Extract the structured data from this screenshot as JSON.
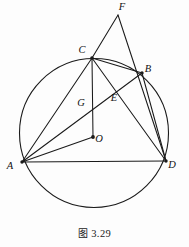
{
  "figure": {
    "caption_prefix": "图",
    "caption_number": "3.29",
    "caption_full": "图 3.29",
    "background_color": "#fdfdfd",
    "stroke_color": "#1a1a1a",
    "label_color": "#111111"
  },
  "geometry": {
    "type": "circle-with-inscribed-quadrilateral",
    "circle": {
      "name": "circumcircle",
      "center_label": "O",
      "cx": 94,
      "cy": 133,
      "r": 74.5,
      "stroke_width": 1.1
    },
    "points": [
      {
        "id": "F",
        "label": "F",
        "x": 118,
        "y": 15,
        "label_x": 122,
        "label_y": 10,
        "on_circle": false,
        "dot": false
      },
      {
        "id": "C",
        "label": "C",
        "x": 92,
        "y": 58,
        "label_x": 82,
        "label_y": 53,
        "on_circle": true,
        "dot": true
      },
      {
        "id": "B",
        "label": "B",
        "x": 142,
        "y": 73,
        "label_x": 148,
        "label_y": 72,
        "on_circle": true,
        "dot": true
      },
      {
        "id": "G",
        "label": "G",
        "x": 92,
        "y": 105,
        "label_x": 81,
        "label_y": 106,
        "on_circle": false,
        "dot": false
      },
      {
        "id": "E",
        "label": "E",
        "x": 111,
        "y": 99,
        "label_x": 114,
        "label_y": 101,
        "on_circle": false,
        "dot": false
      },
      {
        "id": "O",
        "label": "O",
        "x": 93,
        "y": 137,
        "label_x": 99,
        "label_y": 142,
        "on_circle": false,
        "dot": true
      },
      {
        "id": "A",
        "label": "A",
        "x": 22,
        "y": 162,
        "label_x": 10,
        "label_y": 169,
        "on_circle": true,
        "dot": true
      },
      {
        "id": "D",
        "label": "D",
        "x": 166,
        "y": 161,
        "label_x": 172,
        "label_y": 168,
        "on_circle": true,
        "dot": true
      }
    ],
    "segments": [
      {
        "id": "FC",
        "from": "F",
        "to": "C",
        "x1": 118,
        "y1": 15,
        "x2": 92,
        "y2": 58
      },
      {
        "id": "FD",
        "from": "F",
        "to": "D",
        "x1": 118,
        "y1": 15,
        "x2": 166,
        "y2": 161
      },
      {
        "id": "CA",
        "from": "C",
        "to": "A",
        "x1": 92,
        "y1": 58,
        "x2": 22,
        "y2": 162
      },
      {
        "id": "CO",
        "from": "C",
        "to": "O",
        "x1": 92,
        "y1": 58,
        "x2": 93,
        "y2": 137
      },
      {
        "id": "CD",
        "from": "C",
        "to": "D",
        "x1": 92,
        "y1": 58,
        "x2": 166,
        "y2": 161
      },
      {
        "id": "CB",
        "from": "C",
        "to": "B",
        "x1": 92,
        "y1": 58,
        "x2": 142,
        "y2": 73
      },
      {
        "id": "AB",
        "from": "A",
        "to": "B",
        "x1": 22,
        "y1": 162,
        "x2": 142,
        "y2": 73
      },
      {
        "id": "AO",
        "from": "A",
        "to": "O",
        "x1": 22,
        "y1": 162,
        "x2": 93,
        "y2": 137
      },
      {
        "id": "AD",
        "from": "A",
        "to": "D",
        "x1": 22,
        "y1": 162,
        "x2": 166,
        "y2": 161
      },
      {
        "id": "BD",
        "from": "B",
        "to": "D",
        "x1": 142,
        "y1": 73,
        "x2": 166,
        "y2": 161
      }
    ]
  }
}
